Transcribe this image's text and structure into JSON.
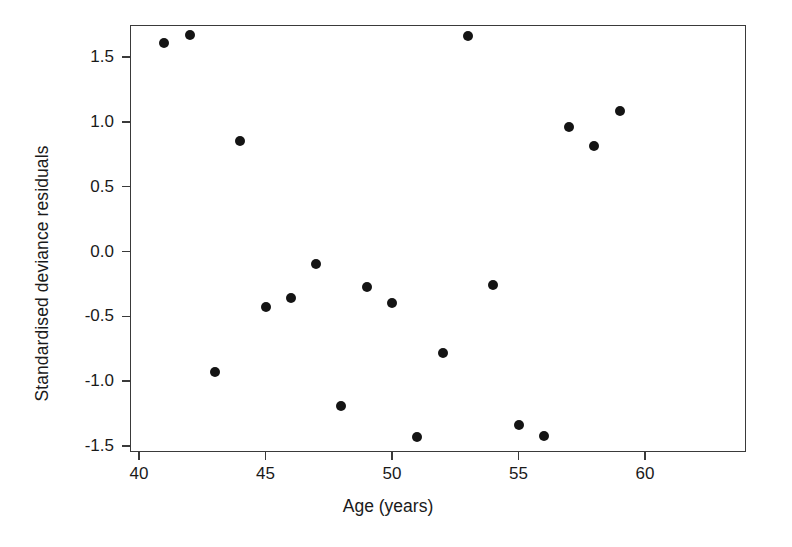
{
  "chart_data": {
    "type": "scatter",
    "title": "",
    "xlabel": "Age (years)",
    "ylabel": "Standardised deviance residuals",
    "xlim": [
      40,
      60
    ],
    "ylim": [
      -1.62,
      1.78
    ],
    "grid": false,
    "legend": null,
    "xticks": [
      40,
      45,
      50,
      55,
      60
    ],
    "xtick_labels": [
      "40",
      "45",
      "50",
      "55",
      "60"
    ],
    "yticks": [
      1.5,
      1.0,
      0.5,
      0.0,
      -0.5,
      -1.0,
      -1.5
    ],
    "ytick_labels": [
      "1.5",
      "1.0",
      "0.5",
      "0.0",
      "-0.5",
      "-1.0",
      "-1.5"
    ],
    "marker": "filled-circle",
    "marker_color": "#141414",
    "marker_size": 10,
    "x": [
      41,
      42,
      43,
      44,
      45,
      46,
      47,
      48,
      49,
      50,
      51,
      52,
      53,
      54,
      55,
      56,
      57,
      58,
      59
    ],
    "y": [
      1.61,
      1.67,
      -0.93,
      0.85,
      -0.43,
      -0.36,
      -0.1,
      -1.19,
      -0.27,
      -0.4,
      -1.43,
      -0.78,
      1.66,
      -0.26,
      -1.34,
      -1.42,
      0.96,
      0.81,
      1.08
    ],
    "points": [
      {
        "x": 41,
        "y": 1.61
      },
      {
        "x": 42,
        "y": 1.67
      },
      {
        "x": 43,
        "y": -0.93
      },
      {
        "x": 44,
        "y": 0.85
      },
      {
        "x": 45,
        "y": -0.43
      },
      {
        "x": 46,
        "y": -0.36
      },
      {
        "x": 47,
        "y": -0.1
      },
      {
        "x": 48,
        "y": -1.19
      },
      {
        "x": 49,
        "y": -0.27
      },
      {
        "x": 50,
        "y": -0.4
      },
      {
        "x": 51,
        "y": -1.43
      },
      {
        "x": 52,
        "y": -0.78
      },
      {
        "x": 53,
        "y": 1.66
      },
      {
        "x": 54,
        "y": -0.26
      },
      {
        "x": 55,
        "y": -1.34
      },
      {
        "x": 56,
        "y": -1.42
      },
      {
        "x": 57,
        "y": 0.96
      },
      {
        "x": 58,
        "y": 0.81
      },
      {
        "x": 59,
        "y": 1.08
      }
    ]
  },
  "style": {
    "axis_color": "#3a3a3a",
    "text_color": "#1a1a1a",
    "background": "#ffffff"
  }
}
